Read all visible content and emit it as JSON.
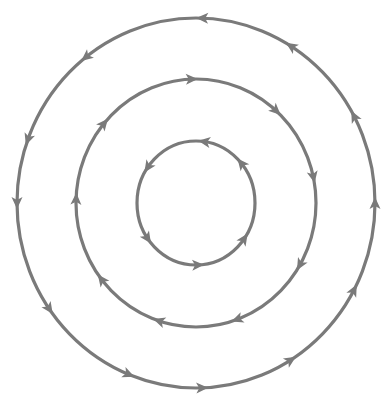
{
  "diagram": {
    "type": "concentric-circulation-loops",
    "center": [
      196,
      203
    ],
    "stroke_color": "#7a7a7a",
    "background": "#ffffff",
    "rings": [
      {
        "name": "outer-ring",
        "rx": 179,
        "ry": 185,
        "direction": "counterclockwise",
        "arrow_angles_deg": [
          88,
          128,
          160,
          180,
          215,
          248,
          272,
          302,
          332,
          0,
          28,
          58
        ]
      },
      {
        "name": "middle-ring",
        "rx": 120,
        "ry": 124,
        "direction": "clockwise",
        "arrow_angles_deg": [
          92,
          140,
          178,
          218,
          252,
          290,
          330,
          12,
          48
        ]
      },
      {
        "name": "inner-ring",
        "rx": 59,
        "ry": 62,
        "direction": "counterclockwise",
        "arrow_angles_deg": [
          82,
          145,
          215,
          272,
          325,
          40
        ]
      }
    ]
  }
}
